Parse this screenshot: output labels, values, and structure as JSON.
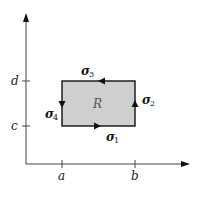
{
  "diagram": {
    "axes": {
      "x_ticks": [
        {
          "label": "a"
        },
        {
          "label": "b"
        }
      ],
      "y_ticks": [
        {
          "label": "c"
        },
        {
          "label": "d"
        }
      ]
    },
    "region": {
      "label": "R",
      "fill": "#cfcfcf",
      "stroke": "#111111"
    },
    "edges": [
      {
        "symbol": "σ",
        "sub": "1",
        "side": "bottom",
        "direction": "right"
      },
      {
        "symbol": "σ",
        "sub": "2",
        "side": "right",
        "direction": "up"
      },
      {
        "symbol": "σ",
        "sub": "3",
        "side": "top",
        "direction": "left"
      },
      {
        "symbol": "σ",
        "sub": "4",
        "side": "left",
        "direction": "down"
      }
    ]
  }
}
